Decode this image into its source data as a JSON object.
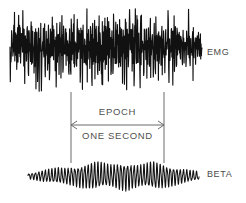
{
  "figure": {
    "width": 246,
    "height": 203,
    "background_color": "#ffffff",
    "trace_color": "#111111",
    "annotation_color": "#4f4f4f"
  },
  "labels": {
    "emg": "EMG",
    "beta": "BETA"
  },
  "annotation": {
    "epoch": "EPOCH",
    "one_second": "ONE SECOND",
    "left_marker_x": 71,
    "right_marker_x": 164,
    "marker_top_y": 92,
    "marker_bottom_y": 163,
    "arrow_y": 125
  },
  "chart_data": {
    "type": "line",
    "title": "",
    "xlabel": "",
    "ylabel": "",
    "grid": false,
    "legend_position": "right",
    "annotations": [
      {
        "text": "EPOCH",
        "type": "span-label",
        "x_start": 71,
        "x_end": 164
      },
      {
        "text": "ONE SECOND",
        "type": "span-label",
        "x_start": 71,
        "x_end": 164
      }
    ],
    "series": [
      {
        "name": "EMG",
        "description": "High-amplitude dense broadband electromyogram noise burst",
        "baseline_y": 47,
        "x_start": 10,
        "x_end": 202,
        "amplitude": 33,
        "density": "very-high",
        "values": [
          0.1,
          -0.42,
          0.55,
          -0.3,
          0.7,
          -0.62,
          0.35,
          -0.8,
          0.48,
          -0.25,
          0.62,
          -0.7,
          0.28,
          -0.45,
          0.84,
          -0.38,
          0.22,
          -0.66,
          0.58,
          -0.9,
          0.4,
          -0.3,
          0.74,
          -0.55,
          0.18,
          -0.72,
          0.66,
          -0.4,
          0.3,
          -0.86,
          0.52,
          -0.2,
          0.78,
          -0.6,
          0.36,
          -0.48,
          0.92,
          -0.34,
          0.26,
          -0.76,
          0.6,
          -0.88,
          0.44,
          -0.28,
          0.7,
          -0.52,
          0.16,
          -0.68,
          0.8,
          -0.44,
          0.32,
          -0.82,
          0.56,
          -0.24,
          0.76,
          -0.64,
          0.38,
          -0.5,
          0.88,
          -0.32,
          0.24,
          -0.78,
          0.64,
          -0.92,
          0.42,
          -0.26,
          0.72,
          -0.58,
          0.2,
          -0.7,
          0.82,
          -0.46,
          0.34,
          -0.84,
          0.54,
          -0.22,
          0.68,
          -0.66,
          0.4,
          -0.54,
          0.9,
          -0.36,
          0.28,
          -0.74,
          0.62,
          -0.86,
          0.46,
          -0.3,
          0.66,
          -0.56,
          0.14,
          -0.62,
          0.78,
          -0.42,
          0.3,
          -0.8,
          0.5,
          -0.18,
          0.72,
          -0.6,
          0.36,
          -0.52,
          0.86,
          -0.28,
          0.22,
          -0.7,
          0.58,
          -0.88,
          0.44,
          -0.24,
          0.7,
          -0.54,
          0.18,
          -0.64,
          0.76,
          -0.4,
          0.32,
          -0.82,
          0.52,
          -0.2,
          0.66,
          -0.62,
          0.38,
          -0.48,
          0.84,
          -0.3,
          0.26,
          -0.72,
          0.6,
          -0.9,
          0.42,
          -0.22,
          0.68,
          -0.56,
          0.16,
          -0.66,
          0.8,
          -0.38,
          0.3,
          -0.78,
          0.48,
          -0.26,
          0.62,
          -0.58,
          0.34,
          -0.44,
          0.74,
          -0.32,
          0.2,
          -0.68,
          0.54,
          -0.84,
          0.4,
          -0.24,
          0.64,
          -0.5,
          0.12,
          -0.6,
          0.72,
          -0.36,
          0.28,
          -0.76,
          0.44,
          -0.18,
          0.58,
          -0.52,
          0.3,
          -0.4,
          0.66,
          -0.28,
          0.18,
          -0.62,
          0.5,
          -0.74,
          0.36,
          -0.2,
          0.56,
          -0.46,
          0.1,
          -0.54,
          0.64,
          -0.32,
          0.24,
          -0.68,
          0.4,
          -0.16,
          0.52,
          -0.44,
          0.26,
          -0.36,
          0.58,
          -0.24,
          0.14,
          -0.5,
          0.42,
          -0.6,
          0.3,
          -0.18,
          0.46,
          -0.38
        ]
      },
      {
        "name": "BETA",
        "description": "Low-amplitude fast rhythmic beta oscillation, spindle-like waxing and waning",
        "baseline_y": 176,
        "x_start": 28,
        "x_end": 199,
        "amplitude": 13,
        "density": "high",
        "envelope": [
          0.18,
          0.24,
          0.32,
          0.4,
          0.46,
          0.52,
          0.58,
          0.55,
          0.6,
          0.66,
          0.72,
          0.8,
          0.88,
          0.95,
          1.0,
          0.94,
          0.86,
          0.8,
          0.88,
          0.96,
          1.0,
          0.92,
          0.84,
          0.78,
          0.86,
          0.94,
          1.0,
          0.9,
          0.8,
          0.72,
          0.64,
          0.56,
          0.48,
          0.42,
          0.36,
          0.3
        ],
        "cycles": 52
      }
    ]
  }
}
